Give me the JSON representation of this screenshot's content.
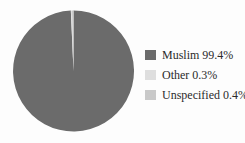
{
  "chart_data": {
    "type": "pie",
    "title": "",
    "categories": [
      "Muslim",
      "Other",
      "Unspecified"
    ],
    "values": [
      99.4,
      0.3,
      0.4
    ],
    "colors": [
      "#6b6b6b",
      "#dedede",
      "#c9c9c9"
    ],
    "start_angle_deg": 0,
    "direction": "clockwise",
    "legend_position": "right",
    "background": "#fdfdfd"
  },
  "legend": {
    "items": [
      {
        "label": "Muslim 99.4%",
        "color": "#6b6b6b"
      },
      {
        "label": "Other 0.3%",
        "color": "#dedede"
      },
      {
        "label": "Unspecified 0.4%",
        "color": "#c9c9c9"
      }
    ]
  },
  "colors": {
    "background": "#fdfdfd",
    "text": "#2b2b2b"
  }
}
